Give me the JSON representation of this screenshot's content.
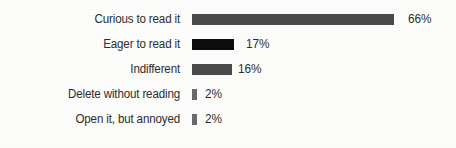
{
  "chart_data": {
    "type": "bar",
    "orientation": "horizontal",
    "title": "",
    "xlabel": "",
    "ylabel": "",
    "xlim": [
      0,
      66
    ],
    "grid": false,
    "legend": false,
    "value_suffix": "%",
    "categories": [
      "Curious to read it",
      "Eager to read it",
      "Indifferent",
      "Delete without reading",
      "Open it, but annoyed"
    ],
    "values": [
      66,
      17,
      16,
      2,
      2
    ],
    "value_labels": [
      "66%",
      "17%",
      "16%",
      "2%",
      "2%"
    ],
    "bar_colors": [
      "#4a4a4a",
      "#0d0d0d",
      "#4a4a4a",
      "#6a6a6a",
      "#6a6a6a"
    ],
    "bar_pixel_widths": [
      202,
      42,
      40,
      5,
      5
    ],
    "rows": [
      {
        "label": "Curious to read it",
        "value": 66,
        "value_label": "66%",
        "color": "#4a4a4a",
        "width_px": 202,
        "gap_px": 14
      },
      {
        "label": "Eager to read it",
        "value": 17,
        "value_label": "17%",
        "color": "#0d0d0d",
        "width_px": 42,
        "gap_px": 12
      },
      {
        "label": "Indifferent",
        "value": 16,
        "value_label": "16%",
        "color": "#4a4a4a",
        "width_px": 40,
        "gap_px": 6
      },
      {
        "label": "Delete without reading",
        "value": 2,
        "value_label": "2%",
        "color": "#6a6a6a",
        "width_px": 5,
        "gap_px": 8
      },
      {
        "label": "Open it, but annoyed",
        "value": 2,
        "value_label": "2%",
        "color": "#6a6a6a",
        "width_px": 5,
        "gap_px": 8
      }
    ]
  },
  "style": {
    "background": "#fdfdfc",
    "text_color": "#2e2e2e",
    "row_height_px": 25,
    "first_row_top_px": 7,
    "label_column_width_px": 180,
    "bar_start_x_px": 192,
    "bar_height_px": 11
  }
}
